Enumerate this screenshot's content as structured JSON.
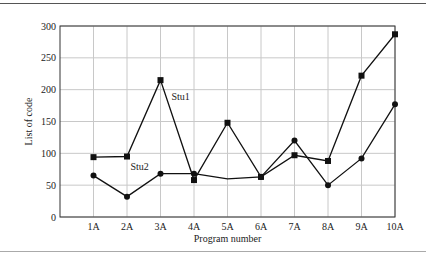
{
  "chart_data": {
    "type": "line",
    "title": "",
    "xlabel": "Program number",
    "ylabel": "List of code",
    "ylim": [
      0,
      300
    ],
    "yticks": [
      0,
      50,
      100,
      150,
      200,
      250,
      300
    ],
    "categories": [
      "1A",
      "2A",
      "3A",
      "4A",
      "5A",
      "6A",
      "7A",
      "8A",
      "9A",
      "10A"
    ],
    "grid": true,
    "series": [
      {
        "name": "Stu1",
        "marker": "square",
        "values": [
          94,
          95,
          215,
          58,
          148,
          63,
          97,
          88,
          222,
          287
        ]
      },
      {
        "name": "Stu2",
        "marker": "circle",
        "values": [
          65,
          32,
          68,
          68,
          60,
          63,
          120,
          50,
          92,
          177
        ],
        "markers_hidden_at": [
          "5A"
        ]
      }
    ],
    "annotations": [
      {
        "text": "Stu1",
        "near": "3A"
      },
      {
        "text": "Stu2",
        "near": "3A"
      }
    ]
  }
}
